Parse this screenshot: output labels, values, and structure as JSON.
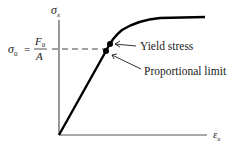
{
  "diagram": {
    "type": "stress-strain curve",
    "y_axis_label": "σ",
    "y_axis_subscript": "x",
    "x_axis_label": "ε",
    "x_axis_subscript": "x",
    "sigma0_label": "σ",
    "sigma0_subscript": "0",
    "equals": "=",
    "fraction_numerator": "F",
    "fraction_numerator_subscript": "0",
    "fraction_denominator": "A",
    "annotations": [
      {
        "label": "Yield stress"
      },
      {
        "label": "Proportional limit"
      }
    ],
    "colors": {
      "line": "#000000",
      "axis": "#555555",
      "dash": "#444444",
      "text": "#222222"
    }
  }
}
